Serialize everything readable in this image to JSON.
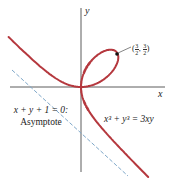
{
  "figure": {
    "curve_equation": "x³ + y³ = 3xy",
    "asymptote_equation": "x + y + 1 = 0:",
    "asymptote_word": "Asymptote",
    "axis_x_label": "x",
    "axis_y_label": "y",
    "point_label": {
      "open": "(",
      "x_num": "3",
      "x_den": "2",
      "sep": ",",
      "y_num": "3",
      "y_den": "2",
      "close": ")"
    },
    "colors": {
      "curve": "#b5383e",
      "asymptote": "#7fa8c9",
      "axes": "#333333",
      "point": "#111111"
    }
  },
  "chart_data": {
    "type": "line",
    "series": [
      {
        "name": "x^3 + y^3 = 3xy",
        "style": "solid",
        "color": "#b5383e"
      },
      {
        "name": "x + y + 1 = 0 (Asymptote)",
        "style": "dashed",
        "color": "#7fa8c9"
      }
    ],
    "annotations": [
      {
        "point": [
          1.5,
          1.5
        ],
        "label": "(3/2, 3/2)"
      }
    ],
    "xlabel": "x",
    "ylabel": "y",
    "grid": false,
    "xlim": [
      -3,
      3.5
    ],
    "ylim": [
      -3.5,
      3.3
    ]
  }
}
